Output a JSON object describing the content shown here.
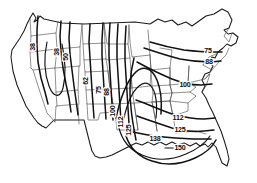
{
  "figure": {
    "title": "",
    "background_color": "#ffffff",
    "line_color": "#111111",
    "state_line_color": "#4a4a4a",
    "coast_line_color": "#1a1a1a"
  },
  "chart_data": {
    "type": "line",
    "subtype": "contour-map",
    "title": "",
    "xlabel": "",
    "ylabel": "",
    "grid": false,
    "legend": "none",
    "contour_levels": [
      38,
      50,
      62,
      75,
      88,
      100,
      112,
      125,
      138,
      150
    ],
    "value_range": [
      38,
      150
    ],
    "contour_interval": 12.5,
    "labels": [
      {
        "id": "l-38-a",
        "text": "38",
        "x": 33,
        "y": 47,
        "rotate": -90,
        "region": "pacific-northwest"
      },
      {
        "id": "l-38-b",
        "text": "38",
        "x": 57,
        "y": 52,
        "rotate": -90,
        "region": "northern-rockies"
      },
      {
        "id": "l-50",
        "text": "50",
        "x": 66,
        "y": 57,
        "rotate": -90,
        "region": "northern-rockies"
      },
      {
        "id": "l-62",
        "text": "62",
        "x": 86,
        "y": 81,
        "rotate": -90,
        "region": "great-plains-west"
      },
      {
        "id": "l-75-a",
        "text": "75",
        "x": 99,
        "y": 90,
        "rotate": -90,
        "region": "great-plains"
      },
      {
        "id": "l-88-a",
        "text": "88",
        "x": 107,
        "y": 92,
        "rotate": -90,
        "region": "great-plains"
      },
      {
        "id": "l-100-a",
        "text": "100",
        "x": 113,
        "y": 111,
        "rotate": -90,
        "region": "southern-plains"
      },
      {
        "id": "l-112-a",
        "text": "112",
        "x": 121,
        "y": 122,
        "rotate": -90,
        "region": "southern-plains"
      },
      {
        "id": "l-125-a",
        "text": "125",
        "x": 129,
        "y": 130,
        "rotate": -90,
        "region": "texas"
      },
      {
        "id": "l-75-b",
        "text": "75",
        "x": 208,
        "y": 51,
        "rotate": 0,
        "region": "new-england"
      },
      {
        "id": "l-88-b",
        "text": "88",
        "x": 209,
        "y": 62,
        "rotate": 0,
        "region": "mid-atlantic-north"
      },
      {
        "id": "l-100-b",
        "text": "100",
        "x": 185,
        "y": 85,
        "rotate": 0,
        "region": "ohio-valley"
      },
      {
        "id": "l-112-b",
        "text": "112",
        "x": 178,
        "y": 118,
        "rotate": 0,
        "region": "tennessee-valley"
      },
      {
        "id": "l-125-b",
        "text": "125",
        "x": 180,
        "y": 130,
        "rotate": 0,
        "region": "deep-south"
      },
      {
        "id": "l-138",
        "text": "138",
        "x": 155,
        "y": 139,
        "rotate": 0,
        "region": "gulf-coast"
      },
      {
        "id": "l-150",
        "text": "150",
        "x": 180,
        "y": 148,
        "rotate": 0,
        "region": "gulf-coast"
      }
    ]
  }
}
